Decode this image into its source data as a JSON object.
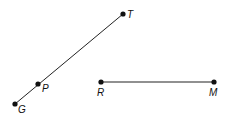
{
  "diagram": {
    "segments": [
      {
        "name": "GT",
        "from": "G",
        "to": "T"
      },
      {
        "name": "RM",
        "from": "R",
        "to": "M"
      }
    ],
    "points": {
      "T": {
        "label": "T",
        "x": 123,
        "y": 14
      },
      "P": {
        "label": "P",
        "x": 38,
        "y": 84
      },
      "G": {
        "label": "G",
        "x": 15,
        "y": 104
      },
      "R": {
        "label": "R",
        "x": 101,
        "y": 82
      },
      "M": {
        "label": "M",
        "x": 214,
        "y": 82
      }
    },
    "colors": {
      "stroke": "#222222",
      "point": "#111111"
    }
  }
}
